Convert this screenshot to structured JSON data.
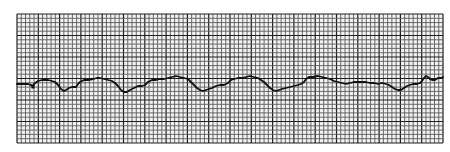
{
  "chart_data": {
    "type": "line",
    "title": "",
    "xlabel": "",
    "ylabel": "",
    "grid": true,
    "grid_area": {
      "x": 17,
      "y": 14,
      "width": 426,
      "height": 129
    },
    "grid_small_px": 4.26,
    "grid_major_every": 5,
    "colors": {
      "background": "#ffffff",
      "paper": "#f2f2f2",
      "minor_line": "#5a5a5a",
      "major_line": "#1e1e1e",
      "trace": "#111111"
    },
    "trace_points": [
      [
        17,
        84
      ],
      [
        28,
        84
      ],
      [
        31,
        85
      ],
      [
        33,
        87
      ],
      [
        34,
        84
      ],
      [
        38,
        81
      ],
      [
        42,
        80
      ],
      [
        48,
        80
      ],
      [
        52,
        81
      ],
      [
        55,
        82
      ],
      [
        58,
        85
      ],
      [
        61,
        89
      ],
      [
        64,
        91
      ],
      [
        66,
        90
      ],
      [
        69,
        88
      ],
      [
        72,
        87
      ],
      [
        76,
        87
      ],
      [
        78,
        84
      ],
      [
        80,
        82
      ],
      [
        84,
        80
      ],
      [
        88,
        80
      ],
      [
        93,
        79
      ],
      [
        97,
        78
      ],
      [
        100,
        78
      ],
      [
        104,
        79
      ],
      [
        108,
        80
      ],
      [
        112,
        81
      ],
      [
        115,
        83
      ],
      [
        118,
        86
      ],
      [
        121,
        90
      ],
      [
        124,
        92
      ],
      [
        127,
        92
      ],
      [
        130,
        90
      ],
      [
        134,
        88
      ],
      [
        138,
        86
      ],
      [
        142,
        86
      ],
      [
        145,
        85
      ],
      [
        148,
        82
      ],
      [
        152,
        80
      ],
      [
        156,
        80
      ],
      [
        160,
        79
      ],
      [
        164,
        79
      ],
      [
        168,
        78
      ],
      [
        172,
        77
      ],
      [
        176,
        76
      ],
      [
        180,
        77
      ],
      [
        184,
        78
      ],
      [
        188,
        79
      ],
      [
        191,
        82
      ],
      [
        194,
        85
      ],
      [
        197,
        88
      ],
      [
        200,
        90
      ],
      [
        203,
        91
      ],
      [
        206,
        90
      ],
      [
        209,
        89
      ],
      [
        212,
        88
      ],
      [
        216,
        86
      ],
      [
        220,
        85
      ],
      [
        224,
        85
      ],
      [
        228,
        83
      ],
      [
        231,
        80
      ],
      [
        234,
        79
      ],
      [
        238,
        78
      ],
      [
        242,
        78
      ],
      [
        246,
        77
      ],
      [
        250,
        76
      ],
      [
        254,
        77
      ],
      [
        258,
        78
      ],
      [
        261,
        80
      ],
      [
        264,
        82
      ],
      [
        267,
        85
      ],
      [
        270,
        88
      ],
      [
        273,
        90
      ],
      [
        276,
        91
      ],
      [
        279,
        90
      ],
      [
        282,
        89
      ],
      [
        286,
        88
      ],
      [
        290,
        87
      ],
      [
        294,
        86
      ],
      [
        298,
        85
      ],
      [
        301,
        84
      ],
      [
        304,
        82
      ],
      [
        306,
        79
      ],
      [
        309,
        77
      ],
      [
        313,
        77
      ],
      [
        318,
        76
      ],
      [
        322,
        77
      ],
      [
        326,
        78
      ],
      [
        330,
        79
      ],
      [
        334,
        81
      ],
      [
        338,
        82
      ],
      [
        342,
        83
      ],
      [
        346,
        84
      ],
      [
        350,
        83
      ],
      [
        354,
        82
      ],
      [
        358,
        82
      ],
      [
        362,
        82
      ],
      [
        366,
        82
      ],
      [
        370,
        83
      ],
      [
        374,
        83
      ],
      [
        378,
        84
      ],
      [
        382,
        83
      ],
      [
        386,
        84
      ],
      [
        389,
        85
      ],
      [
        392,
        87
      ],
      [
        395,
        89
      ],
      [
        398,
        90
      ],
      [
        401,
        90
      ],
      [
        404,
        88
      ],
      [
        407,
        86
      ],
      [
        410,
        85
      ],
      [
        413,
        84
      ],
      [
        417,
        84
      ],
      [
        420,
        83
      ],
      [
        422,
        81
      ],
      [
        424,
        78
      ],
      [
        426,
        76
      ],
      [
        428,
        77
      ],
      [
        430,
        79
      ],
      [
        432,
        80
      ],
      [
        435,
        80
      ],
      [
        438,
        78
      ],
      [
        441,
        78
      ],
      [
        443,
        77
      ]
    ],
    "markers": [
      {
        "x": 33,
        "y": 86,
        "shape": "square",
        "size": 3
      }
    ]
  }
}
